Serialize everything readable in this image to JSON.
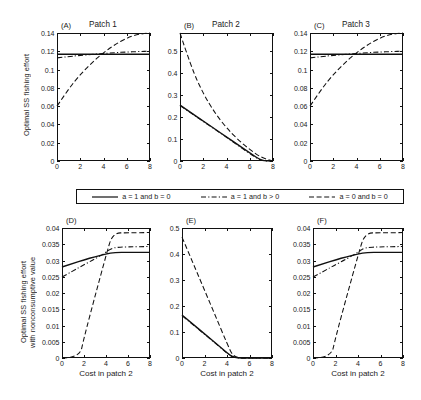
{
  "figure": {
    "ylabel_top": "Optimal SS fishing effort",
    "ylabel_bottom_line1": "Optimal SS fishing effort",
    "ylabel_bottom_line2": "with nonconsumptive value",
    "xlabel": "Cost in patch 2",
    "line_color": "#111111",
    "background": "#ffffff"
  },
  "legend": {
    "items": [
      {
        "label": "a = 1 and b = 0",
        "style": "solid"
      },
      {
        "label": "a = 1 and b > 0",
        "style": "dashdot"
      },
      {
        "label": "a = 0 and b = 0",
        "style": "dashed"
      }
    ]
  },
  "chart_data": [
    {
      "type": "line",
      "panel": "(A)",
      "title": "Patch 1",
      "xlabel": "",
      "ylabel": "Optimal SS fishing effort",
      "xlim": [
        0,
        8
      ],
      "ylim": [
        0,
        0.14
      ],
      "xticks": [
        0,
        2,
        4,
        6,
        8
      ],
      "yticks": [
        0,
        0.02,
        0.04,
        0.06,
        0.08,
        0.1,
        0.12,
        0.14
      ],
      "ytick_labels": [
        "0",
        "0.02",
        "0.04",
        "0.06",
        "0.08",
        "0.1",
        "0.12",
        "0.14"
      ],
      "grid": false,
      "series": [
        {
          "name": "a = 1 and b = 0",
          "style": "solid",
          "x": [
            0,
            1,
            2,
            3,
            4,
            5,
            6,
            7,
            8
          ],
          "values": [
            0.1168,
            0.1168,
            0.1168,
            0.1168,
            0.1168,
            0.1168,
            0.1168,
            0.1168,
            0.1168
          ]
        },
        {
          "name": "a = 1 and b > 0",
          "style": "dashdot",
          "x": [
            0,
            1,
            2,
            3,
            4,
            5,
            6,
            7,
            8
          ],
          "values": [
            0.1128,
            0.1142,
            0.1155,
            0.1166,
            0.1176,
            0.1185,
            0.1192,
            0.1197,
            0.1201
          ]
        },
        {
          "name": "a = 0 and b = 0",
          "style": "dashed",
          "x": [
            0,
            1,
            2,
            3,
            4,
            5,
            6,
            7,
            8
          ],
          "values": [
            0.06,
            0.079,
            0.0945,
            0.1075,
            0.1185,
            0.1275,
            0.1345,
            0.1388,
            0.14
          ]
        }
      ]
    },
    {
      "type": "line",
      "panel": "(B)",
      "title": "Patch 2",
      "xlabel": "",
      "ylabel": "",
      "xlim": [
        0,
        8
      ],
      "ylim": [
        0,
        0.58
      ],
      "xticks": [
        0,
        2,
        4,
        6,
        8
      ],
      "yticks": [
        0,
        0.1,
        0.2,
        0.3,
        0.4,
        0.5
      ],
      "ytick_labels": [
        "0",
        "0.1",
        "0.2",
        "0.3",
        "0.4",
        "0.5"
      ],
      "grid": false,
      "series": [
        {
          "name": "a = 1 and b = 0",
          "style": "solid",
          "x": [
            0,
            1,
            2,
            3,
            4,
            5,
            6,
            7,
            8
          ],
          "values": [
            0.253,
            0.217,
            0.181,
            0.145,
            0.109,
            0.073,
            0.037,
            0.001,
            0.0
          ]
        },
        {
          "name": "a = 1 and b > 0",
          "style": "dashdot",
          "x": [
            0,
            1,
            2,
            3,
            4,
            5,
            6,
            7,
            8
          ],
          "values": [
            0.2515,
            0.2155,
            0.1795,
            0.1435,
            0.1075,
            0.0705,
            0.033,
            0.0,
            0.0
          ]
        },
        {
          "name": "a = 0 and b = 0",
          "style": "dashed",
          "x": [
            0,
            1,
            2,
            3,
            4,
            5,
            6,
            7,
            8
          ],
          "values": [
            0.58,
            0.42,
            0.305,
            0.218,
            0.15,
            0.096,
            0.052,
            0.015,
            0.0
          ]
        }
      ]
    },
    {
      "type": "line",
      "panel": "(C)",
      "title": "Patch 3",
      "xlabel": "",
      "ylabel": "",
      "xlim": [
        0,
        8
      ],
      "ylim": [
        0,
        0.14
      ],
      "xticks": [
        0,
        2,
        4,
        6,
        8
      ],
      "yticks": [
        0,
        0.02,
        0.04,
        0.06,
        0.08,
        0.1,
        0.12,
        0.14
      ],
      "ytick_labels": [
        "0",
        "0.02",
        "0.04",
        "0.06",
        "0.08",
        "0.1",
        "0.12",
        "0.14"
      ],
      "grid": false,
      "series": [
        {
          "name": "a = 1 and b = 0",
          "style": "solid",
          "x": [
            0,
            1,
            2,
            3,
            4,
            5,
            6,
            7,
            8
          ],
          "values": [
            0.1168,
            0.1168,
            0.1168,
            0.1168,
            0.1168,
            0.1168,
            0.1168,
            0.1168,
            0.1168
          ]
        },
        {
          "name": "a = 1 and b > 0",
          "style": "dashdot",
          "x": [
            0,
            1,
            2,
            3,
            4,
            5,
            6,
            7,
            8
          ],
          "values": [
            0.1128,
            0.1142,
            0.1155,
            0.1166,
            0.1176,
            0.1185,
            0.1192,
            0.1197,
            0.1201
          ]
        },
        {
          "name": "a = 0 and b = 0",
          "style": "dashed",
          "x": [
            0,
            1,
            2,
            3,
            4,
            5,
            6,
            7,
            8
          ],
          "values": [
            0.06,
            0.079,
            0.0945,
            0.1075,
            0.1185,
            0.1275,
            0.1345,
            0.1388,
            0.14
          ]
        }
      ]
    },
    {
      "type": "line",
      "panel": "(D)",
      "title": "",
      "xlabel": "Cost in patch 2",
      "ylabel": "Optimal SS fishing effort with nonconsumptive value",
      "xlim": [
        0,
        8
      ],
      "ylim": [
        0,
        0.04
      ],
      "xticks": [
        0,
        2,
        4,
        6,
        8
      ],
      "yticks": [
        0,
        0.005,
        0.01,
        0.015,
        0.02,
        0.025,
        0.03,
        0.035,
        0.04
      ],
      "ytick_labels": [
        "0",
        "0.005",
        "0.01",
        "0.015",
        "0.02",
        "0.025",
        "0.03",
        "0.035",
        "0.04"
      ],
      "grid": false,
      "series": [
        {
          "name": "a = 1 and b = 0",
          "style": "solid",
          "x": [
            0,
            1,
            2,
            3,
            4,
            4.8,
            6,
            8
          ],
          "values": [
            0.028,
            0.0291,
            0.0302,
            0.0312,
            0.032,
            0.0325,
            0.0325,
            0.0325
          ]
        },
        {
          "name": "a = 1 and b > 0",
          "style": "dashdot",
          "x": [
            0,
            1,
            2,
            3,
            4,
            4.6,
            6,
            8
          ],
          "values": [
            0.0249,
            0.0268,
            0.0287,
            0.0305,
            0.0325,
            0.034,
            0.0342,
            0.0343
          ]
        },
        {
          "name": "a = 0 and b = 0",
          "style": "dashed",
          "x": [
            0,
            1.6,
            2,
            3,
            4,
            4.6,
            6,
            8
          ],
          "values": [
            0.0,
            0.0,
            0.0062,
            0.019,
            0.0315,
            0.0385,
            0.0385,
            0.0386
          ]
        }
      ]
    },
    {
      "type": "line",
      "panel": "(E)",
      "title": "",
      "xlabel": "Cost in patch 2",
      "ylabel": "",
      "xlim": [
        0,
        8
      ],
      "ylim": [
        0,
        0.5
      ],
      "xticks": [
        0,
        2,
        4,
        6,
        8
      ],
      "yticks": [
        0,
        0.1,
        0.2,
        0.3,
        0.4,
        0.5
      ],
      "ytick_labels": [
        "0",
        "0.1",
        "0.2",
        "0.3",
        "0.4",
        "0.5"
      ],
      "grid": false,
      "series": [
        {
          "name": "a = 1 and b = 0",
          "style": "solid",
          "x": [
            0,
            1,
            2,
            3,
            4,
            4.6,
            6,
            8
          ],
          "values": [
            0.165,
            0.129,
            0.093,
            0.057,
            0.02,
            0.0,
            0.0,
            0.0
          ]
        },
        {
          "name": "a = 1 and b > 0",
          "style": "dashdot",
          "x": [
            0,
            1,
            2,
            3,
            4,
            4.6,
            6,
            8
          ],
          "values": [
            0.163,
            0.1275,
            0.0915,
            0.0555,
            0.0185,
            0.0,
            0.0,
            0.0
          ]
        },
        {
          "name": "a = 0 and b = 0",
          "style": "dashed",
          "x": [
            0,
            1,
            2,
            3,
            4,
            4.6,
            6,
            8
          ],
          "values": [
            0.465,
            0.363,
            0.261,
            0.159,
            0.056,
            0.0,
            0.0,
            0.0
          ]
        }
      ]
    },
    {
      "type": "line",
      "panel": "(F)",
      "title": "",
      "xlabel": "Cost in patch 2",
      "ylabel": "",
      "xlim": [
        0,
        8
      ],
      "ylim": [
        0,
        0.04
      ],
      "xticks": [
        0,
        2,
        4,
        6,
        8
      ],
      "yticks": [
        0,
        0.005,
        0.01,
        0.015,
        0.02,
        0.025,
        0.03,
        0.035,
        0.04
      ],
      "ytick_labels": [
        "0",
        "0.005",
        "0.01",
        "0.015",
        "0.02",
        "0.025",
        "0.03",
        "0.035",
        "0.04"
      ],
      "grid": false,
      "series": [
        {
          "name": "a = 1 and b = 0",
          "style": "solid",
          "x": [
            0,
            1,
            2,
            3,
            4,
            4.8,
            6,
            8
          ],
          "values": [
            0.028,
            0.0291,
            0.0302,
            0.0312,
            0.032,
            0.0325,
            0.0325,
            0.0325
          ]
        },
        {
          "name": "a = 1 and b > 0",
          "style": "dashdot",
          "x": [
            0,
            1,
            2,
            3,
            4,
            4.6,
            6,
            8
          ],
          "values": [
            0.0249,
            0.0268,
            0.0287,
            0.0305,
            0.0325,
            0.034,
            0.0342,
            0.0343
          ]
        },
        {
          "name": "a = 0 and b = 0",
          "style": "dashed",
          "x": [
            0,
            1.6,
            2,
            3,
            4,
            4.6,
            6,
            8
          ],
          "values": [
            0.0,
            0.0,
            0.0062,
            0.019,
            0.0315,
            0.0385,
            0.0385,
            0.0386
          ]
        }
      ]
    }
  ]
}
